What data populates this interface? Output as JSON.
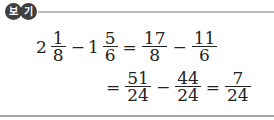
{
  "header": {
    "badge": [
      "보",
      "기"
    ]
  },
  "expression": {
    "row1": {
      "term1": {
        "whole": "2",
        "num": "1",
        "den": "8"
      },
      "op1": "−",
      "term2": {
        "whole": "1",
        "num": "5",
        "den": "6"
      },
      "eq": "=",
      "term3": {
        "num": "17",
        "den": "8"
      },
      "op2": "−",
      "term4": {
        "num": "11",
        "den": "6"
      }
    },
    "row2": {
      "eq1": "=",
      "term1": {
        "num": "51",
        "den": "24"
      },
      "op": "−",
      "term2": {
        "num": "44",
        "den": "24"
      },
      "eq2": "=",
      "result": {
        "num": "7",
        "den": "24"
      }
    }
  }
}
